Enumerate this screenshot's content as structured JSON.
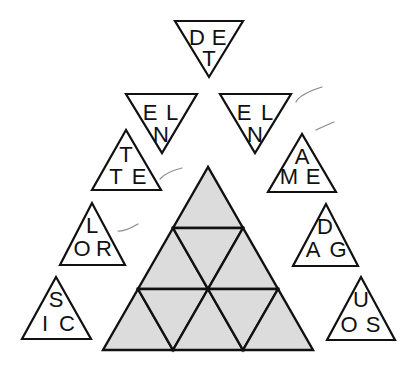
{
  "puzzle": {
    "description": "Triangle word puzzle: letter triangles surrounding a large shaded triangle divided into nine cells",
    "colors": {
      "outline": "#111111",
      "grid_fill": "#dcdcdc",
      "background": "#ffffff",
      "tick": "#8a8a8a"
    },
    "letter_triangles": [
      {
        "id": "top",
        "orientation": "down",
        "letters": [
          "D",
          "E",
          "T"
        ]
      },
      {
        "id": "upper-left",
        "orientation": "down",
        "letters": [
          "E",
          "L",
          "N"
        ]
      },
      {
        "id": "upper-right",
        "orientation": "down",
        "letters": [
          "E",
          "L",
          "N"
        ]
      },
      {
        "id": "mid-left",
        "orientation": "up",
        "letters": [
          "T",
          "T",
          "E"
        ]
      },
      {
        "id": "mid-right",
        "orientation": "up",
        "letters": [
          "A",
          "M",
          "E"
        ]
      },
      {
        "id": "lower-left",
        "orientation": "up",
        "letters": [
          "L",
          "O",
          "R"
        ]
      },
      {
        "id": "lower-right",
        "orientation": "up",
        "letters": [
          "D",
          "A",
          "G"
        ]
      },
      {
        "id": "bottom-left",
        "orientation": "up",
        "letters": [
          "S",
          "I",
          "C"
        ]
      },
      {
        "id": "bottom-right",
        "orientation": "up",
        "letters": [
          "U",
          "O",
          "S"
        ]
      }
    ],
    "grid": {
      "rows": 3,
      "cells": 9
    }
  }
}
